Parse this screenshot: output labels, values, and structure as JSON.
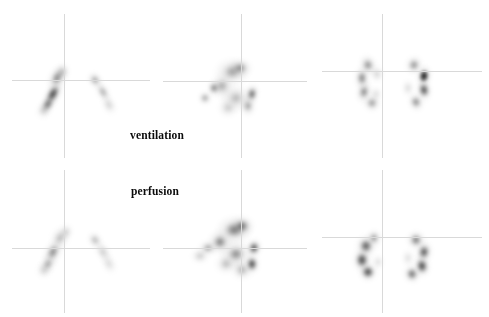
{
  "study": {
    "modality": "nuclear-medicine-scintigraphy",
    "background_color": "#ffffff",
    "crosshair_color": "#d9d9d9",
    "blob_color": "#000000",
    "canvas": {
      "width": 489,
      "height": 317
    }
  },
  "labels": [
    {
      "name": "ventilation-label",
      "text": "ventilation",
      "x": 130,
      "y": 129
    },
    {
      "name": "perfusion-label",
      "text": "perfusion",
      "x": 131,
      "y": 185
    }
  ],
  "rows": [
    {
      "name": "ventilation-row",
      "series_label": "ventilation",
      "panels": [
        {
          "name": "ventilation-panel-posterior",
          "view": "posterior",
          "x": 0,
          "y": 10,
          "w": 160,
          "h": 150,
          "crosshair": {
            "vx": 64,
            "vy0": 14,
            "vy1": 158,
            "hy": 80,
            "hx0": 12,
            "hx1": 150
          },
          "blobs": [
            {
              "cx": 57,
              "cy": 68,
              "rx": 9,
              "ry": 15,
              "rot": 28,
              "intensity": 0.62,
              "softness": 0.45
            },
            {
              "cx": 53,
              "cy": 84,
              "rx": 8,
              "ry": 17,
              "rot": 30,
              "intensity": 0.95,
              "softness": 0.35
            },
            {
              "cx": 48,
              "cy": 94,
              "rx": 7,
              "ry": 12,
              "rot": 30,
              "intensity": 0.8,
              "softness": 0.4
            },
            {
              "cx": 62,
              "cy": 62,
              "rx": 7,
              "ry": 9,
              "rot": 20,
              "intensity": 0.5,
              "softness": 0.55
            },
            {
              "cx": 44,
              "cy": 100,
              "rx": 7,
              "ry": 9,
              "rot": 25,
              "intensity": 0.45,
              "softness": 0.6
            },
            {
              "cx": 95,
              "cy": 70,
              "rx": 7,
              "ry": 9,
              "rot": -35,
              "intensity": 0.58,
              "softness": 0.5
            },
            {
              "cx": 103,
              "cy": 82,
              "rx": 6,
              "ry": 13,
              "rot": -30,
              "intensity": 0.52,
              "softness": 0.5
            },
            {
              "cx": 109,
              "cy": 95,
              "rx": 6,
              "ry": 10,
              "rot": -28,
              "intensity": 0.4,
              "softness": 0.6
            }
          ]
        },
        {
          "name": "ventilation-panel-coronal",
          "view": "coronal",
          "x": 160,
          "y": 10,
          "w": 160,
          "h": 150,
          "crosshair": {
            "vx": 241,
            "vy0": 14,
            "vy1": 158,
            "hy": 81,
            "hx0": 163,
            "hx1": 307
          },
          "blobs": [
            {
              "cx": 72,
              "cy": 62,
              "rx": 18,
              "ry": 14,
              "rot": 0,
              "intensity": 0.48,
              "softness": 0.55
            },
            {
              "cx": 80,
              "cy": 58,
              "rx": 13,
              "ry": 10,
              "rot": 0,
              "intensity": 0.55,
              "softness": 0.5
            },
            {
              "cx": 62,
              "cy": 76,
              "rx": 12,
              "ry": 13,
              "rot": 0,
              "intensity": 0.52,
              "softness": 0.55
            },
            {
              "cx": 54,
              "cy": 78,
              "rx": 7,
              "ry": 8,
              "rot": 0,
              "intensity": 0.72,
              "softness": 0.42
            },
            {
              "cx": 45,
              "cy": 88,
              "rx": 7,
              "ry": 7,
              "rot": 0,
              "intensity": 0.6,
              "softness": 0.5
            },
            {
              "cx": 76,
              "cy": 88,
              "rx": 16,
              "ry": 14,
              "rot": 0,
              "intensity": 0.42,
              "softness": 0.6
            },
            {
              "cx": 92,
              "cy": 84,
              "rx": 7,
              "ry": 11,
              "rot": 10,
              "intensity": 0.85,
              "softness": 0.38
            },
            {
              "cx": 88,
              "cy": 96,
              "rx": 8,
              "ry": 11,
              "rot": 0,
              "intensity": 0.55,
              "softness": 0.52
            },
            {
              "cx": 68,
              "cy": 98,
              "rx": 10,
              "ry": 9,
              "rot": 0,
              "intensity": 0.38,
              "softness": 0.62
            }
          ]
        },
        {
          "name": "ventilation-panel-anterior",
          "view": "anterior",
          "x": 320,
          "y": 10,
          "w": 169,
          "h": 150,
          "crosshair": {
            "vx": 382,
            "vy0": 14,
            "vy1": 158,
            "hy": 71,
            "hx0": 322,
            "hx1": 482
          },
          "blobs": [
            {
              "cx": 48,
              "cy": 55,
              "rx": 9,
              "ry": 11,
              "rot": -20,
              "intensity": 0.62,
              "softness": 0.48
            },
            {
              "cx": 42,
              "cy": 68,
              "rx": 8,
              "ry": 13,
              "rot": 0,
              "intensity": 0.68,
              "softness": 0.45
            },
            {
              "cx": 44,
              "cy": 82,
              "rx": 8,
              "ry": 12,
              "rot": 15,
              "intensity": 0.66,
              "softness": 0.46
            },
            {
              "cx": 52,
              "cy": 93,
              "rx": 9,
              "ry": 9,
              "rot": 25,
              "intensity": 0.6,
              "softness": 0.5
            },
            {
              "cx": 57,
              "cy": 64,
              "rx": 6,
              "ry": 8,
              "rot": 0,
              "intensity": 0.4,
              "softness": 0.6
            },
            {
              "cx": 56,
              "cy": 84,
              "rx": 5,
              "ry": 7,
              "rot": 0,
              "intensity": 0.35,
              "softness": 0.62
            },
            {
              "cx": 94,
              "cy": 55,
              "rx": 9,
              "ry": 10,
              "rot": 20,
              "intensity": 0.62,
              "softness": 0.48
            },
            {
              "cx": 104,
              "cy": 66,
              "rx": 9,
              "ry": 12,
              "rot": 10,
              "intensity": 0.98,
              "softness": 0.3
            },
            {
              "cx": 104,
              "cy": 80,
              "rx": 8,
              "ry": 12,
              "rot": -10,
              "intensity": 0.9,
              "softness": 0.34
            },
            {
              "cx": 96,
              "cy": 92,
              "rx": 8,
              "ry": 10,
              "rot": -20,
              "intensity": 0.66,
              "softness": 0.46
            },
            {
              "cx": 88,
              "cy": 78,
              "rx": 5,
              "ry": 8,
              "rot": 0,
              "intensity": 0.38,
              "softness": 0.62
            }
          ]
        }
      ]
    },
    {
      "name": "perfusion-row",
      "series_label": "perfusion",
      "panels": [
        {
          "name": "perfusion-panel-posterior",
          "view": "posterior",
          "x": 0,
          "y": 166,
          "w": 160,
          "h": 151,
          "crosshair": {
            "vx": 64,
            "vy0": 170,
            "vy1": 313,
            "hy": 248,
            "hx0": 12,
            "hx1": 150
          },
          "blobs": [
            {
              "cx": 60,
              "cy": 72,
              "rx": 9,
              "ry": 12,
              "rot": 25,
              "intensity": 0.45,
              "softness": 0.55
            },
            {
              "cx": 53,
              "cy": 86,
              "rx": 9,
              "ry": 15,
              "rot": 28,
              "intensity": 0.62,
              "softness": 0.46
            },
            {
              "cx": 48,
              "cy": 98,
              "rx": 8,
              "ry": 12,
              "rot": 28,
              "intensity": 0.5,
              "softness": 0.54
            },
            {
              "cx": 66,
              "cy": 66,
              "rx": 6,
              "ry": 8,
              "rot": 15,
              "intensity": 0.4,
              "softness": 0.6
            },
            {
              "cx": 44,
              "cy": 104,
              "rx": 7,
              "ry": 8,
              "rot": 20,
              "intensity": 0.35,
              "softness": 0.64
            },
            {
              "cx": 95,
              "cy": 74,
              "rx": 7,
              "ry": 9,
              "rot": -35,
              "intensity": 0.48,
              "softness": 0.54
            },
            {
              "cx": 103,
              "cy": 86,
              "rx": 6,
              "ry": 13,
              "rot": -30,
              "intensity": 0.42,
              "softness": 0.56
            },
            {
              "cx": 109,
              "cy": 98,
              "rx": 6,
              "ry": 10,
              "rot": -28,
              "intensity": 0.32,
              "softness": 0.64
            }
          ]
        },
        {
          "name": "perfusion-panel-coronal",
          "view": "coronal",
          "x": 160,
          "y": 166,
          "w": 160,
          "h": 151,
          "crosshair": {
            "vx": 241,
            "vy0": 170,
            "vy1": 313,
            "hy": 248,
            "hx0": 163,
            "hx1": 307
          },
          "blobs": [
            {
              "cx": 74,
              "cy": 64,
              "rx": 19,
              "ry": 15,
              "rot": 0,
              "intensity": 0.6,
              "softness": 0.48
            },
            {
              "cx": 82,
              "cy": 60,
              "rx": 13,
              "ry": 11,
              "rot": 0,
              "intensity": 0.68,
              "softness": 0.44
            },
            {
              "cx": 60,
              "cy": 76,
              "rx": 13,
              "ry": 13,
              "rot": 0,
              "intensity": 0.62,
              "softness": 0.48
            },
            {
              "cx": 48,
              "cy": 82,
              "rx": 10,
              "ry": 8,
              "rot": 0,
              "intensity": 0.55,
              "softness": 0.52
            },
            {
              "cx": 40,
              "cy": 90,
              "rx": 9,
              "ry": 7,
              "rot": 0,
              "intensity": 0.45,
              "softness": 0.58
            },
            {
              "cx": 76,
              "cy": 88,
              "rx": 17,
              "ry": 15,
              "rot": 0,
              "intensity": 0.55,
              "softness": 0.52
            },
            {
              "cx": 94,
              "cy": 82,
              "rx": 8,
              "ry": 10,
              "rot": 10,
              "intensity": 0.92,
              "softness": 0.32
            },
            {
              "cx": 92,
              "cy": 98,
              "rx": 8,
              "ry": 11,
              "rot": 0,
              "intensity": 0.95,
              "softness": 0.32
            },
            {
              "cx": 82,
              "cy": 104,
              "rx": 11,
              "ry": 10,
              "rot": 0,
              "intensity": 0.52,
              "softness": 0.55
            },
            {
              "cx": 66,
              "cy": 98,
              "rx": 11,
              "ry": 10,
              "rot": 0,
              "intensity": 0.45,
              "softness": 0.58
            }
          ]
        },
        {
          "name": "perfusion-panel-anterior",
          "view": "anterior",
          "x": 320,
          "y": 166,
          "w": 169,
          "h": 151,
          "crosshair": {
            "vx": 382,
            "vy0": 170,
            "vy1": 313,
            "hy": 237,
            "hx0": 322,
            "hx1": 482
          },
          "blobs": [
            {
              "cx": 46,
              "cy": 80,
              "rx": 11,
              "ry": 12,
              "rot": -15,
              "intensity": 0.82,
              "softness": 0.38
            },
            {
              "cx": 42,
              "cy": 94,
              "rx": 10,
              "ry": 13,
              "rot": 0,
              "intensity": 0.88,
              "softness": 0.35
            },
            {
              "cx": 48,
              "cy": 106,
              "rx": 10,
              "ry": 10,
              "rot": 20,
              "intensity": 0.92,
              "softness": 0.33
            },
            {
              "cx": 54,
              "cy": 72,
              "rx": 8,
              "ry": 9,
              "rot": 0,
              "intensity": 0.6,
              "softness": 0.48
            },
            {
              "cx": 58,
              "cy": 96,
              "rx": 5,
              "ry": 7,
              "rot": 0,
              "intensity": 0.35,
              "softness": 0.64
            },
            {
              "cx": 96,
              "cy": 74,
              "rx": 10,
              "ry": 10,
              "rot": 20,
              "intensity": 0.7,
              "softness": 0.44
            },
            {
              "cx": 104,
              "cy": 86,
              "rx": 9,
              "ry": 12,
              "rot": 10,
              "intensity": 0.86,
              "softness": 0.36
            },
            {
              "cx": 102,
              "cy": 100,
              "rx": 9,
              "ry": 12,
              "rot": -10,
              "intensity": 0.92,
              "softness": 0.33
            },
            {
              "cx": 92,
              "cy": 108,
              "rx": 9,
              "ry": 10,
              "rot": -20,
              "intensity": 0.78,
              "softness": 0.4
            },
            {
              "cx": 88,
              "cy": 92,
              "rx": 5,
              "ry": 8,
              "rot": 0,
              "intensity": 0.34,
              "softness": 0.64
            }
          ]
        }
      ]
    }
  ]
}
